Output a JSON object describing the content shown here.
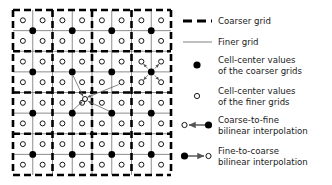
{
  "figure": {
    "title": "",
    "grid": {
      "x0": 13,
      "y0": 10,
      "x1": 171,
      "y1": 175,
      "fine_divisions": 8,
      "coarse_divisions": 4,
      "coarse_line_color": "#000000",
      "fine_line_color": "#808080",
      "coarse_line_width": 2.6,
      "fine_line_width": 0.9,
      "coarse_dash": "7,4",
      "fine_dot_radius": 2.5,
      "coarse_dot_radius": 3.4,
      "fine_dot_color": "#ffffff",
      "fine_dot_stroke": "#000000",
      "coarse_dot_color": "#000000"
    },
    "annotations": [
      {
        "name": "coarse-to-fine-group-right",
        "kind": "coarse-to-fine",
        "source_x": 145.8,
        "source_y": 72.8,
        "targets": [
          {
            "x": 130.0,
            "y": 62.6
          },
          {
            "x": 160.5,
            "y": 62.6
          },
          {
            "x": 130.0,
            "y": 83.2
          },
          {
            "x": 160.5,
            "y": 83.2
          }
        ]
      },
      {
        "name": "fine-to-coarse-group-center",
        "kind": "fine-to-coarse",
        "target_x": 85.0,
        "target_y": 103.0,
        "sources": [
          {
            "x": 69.5,
            "y": 72.8
          },
          {
            "x": 69.5,
            "y": 113.2
          },
          {
            "x": 110.0,
            "y": 113.2
          },
          {
            "x": 120.5,
            "y": 83.2
          }
        ]
      }
    ]
  },
  "legend": {
    "items": [
      {
        "id": "coarser-grid",
        "symbol": "dashed-line",
        "lines": [
          "Coarser grid"
        ]
      },
      {
        "id": "finer-grid",
        "symbol": "solid-line",
        "lines": [
          "Finer grid"
        ]
      },
      {
        "id": "coarse-cell-centers",
        "symbol": "filled-circle",
        "lines": [
          "Cell-center values",
          "of the coarser grids"
        ]
      },
      {
        "id": "fine-cell-centers",
        "symbol": "open-circle",
        "lines": [
          "Cell-center values",
          "of the finer grids"
        ]
      },
      {
        "id": "coarse-to-fine",
        "symbol": "arrow-filled-to-open",
        "lines": [
          "Coarse-to-fine",
          "bilinear interpolation"
        ]
      },
      {
        "id": "fine-to-coarse",
        "symbol": "arrow-open-to-filled",
        "lines": [
          "Fine-to-coarse",
          "bilinear interpolation"
        ]
      }
    ]
  },
  "colors": {
    "ink": "#1a1a1a",
    "black": "#000000",
    "gray": "#808080",
    "white": "#ffffff"
  }
}
